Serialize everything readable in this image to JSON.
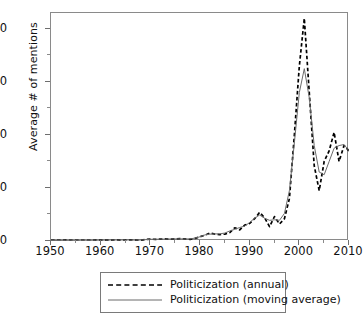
{
  "chart_data": {
    "type": "line",
    "title": "",
    "xlabel": "",
    "ylabel": "Average # of mentions",
    "xlim": [
      1950,
      2010
    ],
    "ylim": [
      0,
      43
    ],
    "grid": false,
    "legend_position": "below-plot",
    "x_ticks": [
      "1950",
      "1960",
      "1970",
      "1980",
      "1990",
      "2000",
      "2010"
    ],
    "y_ticks": [
      "0",
      "10",
      "20",
      "30",
      "40"
    ],
    "x_tick_values": [
      1950,
      1960,
      1970,
      1980,
      1990,
      2000,
      2010
    ],
    "y_tick_values": [
      0,
      10,
      20,
      30,
      40
    ],
    "x_minor_tick_values": [
      1955,
      1965,
      1975,
      1985,
      1995,
      2005
    ],
    "y_minor_tick_values": [
      5,
      15,
      25,
      35
    ],
    "x": [
      1950,
      1951,
      1952,
      1953,
      1954,
      1955,
      1956,
      1957,
      1958,
      1959,
      1960,
      1961,
      1962,
      1963,
      1964,
      1965,
      1966,
      1967,
      1968,
      1969,
      1970,
      1971,
      1972,
      1973,
      1974,
      1975,
      1976,
      1977,
      1978,
      1979,
      1980,
      1981,
      1982,
      1983,
      1984,
      1985,
      1986,
      1987,
      1988,
      1989,
      1990,
      1991,
      1992,
      1993,
      1994,
      1995,
      1996,
      1997,
      1998,
      1999,
      2000,
      2001,
      2002,
      2003,
      2004,
      2005,
      2006,
      2007,
      2008,
      2009,
      2010
    ],
    "series": [
      {
        "name": "Politicization (annual)",
        "style": "dashed",
        "color": "#000000",
        "values": [
          0.1,
          0.1,
          0.1,
          0.15,
          0.1,
          0.12,
          0.12,
          0.1,
          0.12,
          0.15,
          0.15,
          0.18,
          0.15,
          0.2,
          0.18,
          0.2,
          0.22,
          0.15,
          0.1,
          0.3,
          0.35,
          0.3,
          0.35,
          0.4,
          0.35,
          0.4,
          0.45,
          0.4,
          0.3,
          0.5,
          0.8,
          1.1,
          1.5,
          1.3,
          1.2,
          1.3,
          1.6,
          2.5,
          2.1,
          3.0,
          3.3,
          4.2,
          5.4,
          4.4,
          2.7,
          4.6,
          3.2,
          4.2,
          8.0,
          20.0,
          33.0,
          42.0,
          28.0,
          14.2,
          9.5,
          15.0,
          17.0,
          20.5,
          15.0,
          18.0,
          17.0
        ]
      },
      {
        "name": "Politicization (moving average)",
        "style": "solid",
        "color": "#6b6b6b",
        "values": [
          0.1,
          0.1,
          0.11,
          0.12,
          0.12,
          0.12,
          0.12,
          0.12,
          0.13,
          0.14,
          0.16,
          0.16,
          0.18,
          0.18,
          0.19,
          0.2,
          0.19,
          0.16,
          0.18,
          0.25,
          0.32,
          0.33,
          0.35,
          0.36,
          0.38,
          0.4,
          0.4,
          0.38,
          0.4,
          0.55,
          0.8,
          1.15,
          1.3,
          1.33,
          1.35,
          1.5,
          1.9,
          2.2,
          2.55,
          2.8,
          3.5,
          4.3,
          4.9,
          4.3,
          3.9,
          4.0,
          3.9,
          5.2,
          9.5,
          18.5,
          28.0,
          32.5,
          27.0,
          18.0,
          13.0,
          12.5,
          15.0,
          17.5,
          18.0,
          18.2,
          17.0
        ]
      }
    ]
  },
  "legend": {
    "items": [
      {
        "label": "Politicization (annual)",
        "style": "dashed"
      },
      {
        "label": "Politicization (moving average)",
        "style": "solid"
      }
    ]
  }
}
